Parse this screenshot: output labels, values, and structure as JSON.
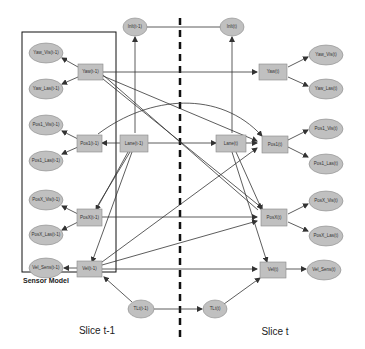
{
  "diagram": {
    "type": "dynamic-bayesian-network",
    "colors": {
      "node_fill": "#c0c0c0",
      "node_stroke": "#888888",
      "edge": "#333333",
      "divider": "#111111",
      "box": "#111111"
    },
    "sensor_model_label": "Sensor Model",
    "slice_labels": {
      "left": "Slice t-1",
      "right": "Slice t"
    },
    "nodes": {
      "inlt_prev": "Inlt(t-1)",
      "inlt_curr": "Inlt(t)",
      "yaw_vis_prev": "Yaw_Vis(t-1)",
      "yaw_las_prev": "Yaw_Las(t-1)",
      "yaw_prev": "Yaw(t-1)",
      "yaw_curr": "Yaw(t)",
      "yaw_vis_curr": "Yaw_Vis(t)",
      "yaw_las_curr": "Yaw_Las(t)",
      "pos1_vis_prev": "Pos1_Vis(t-1)",
      "pos1_las_prev": "Pos1_Las(t-1)",
      "pos1_prev": "Pos1(t-1)",
      "lane_prev": "Lane(t-1)",
      "lane_curr": "Lane(t)",
      "pos1_curr": "Pos1(t)",
      "pos1_vis_curr": "Pos1_Vis(t)",
      "pos1_las_curr": "Pos1_Las(t)",
      "posx_vis_prev": "PosX_Vis(t-1)",
      "posx_las_prev": "PosX_Las(t-1)",
      "posx_prev": "PosX(t-1)",
      "posx_curr": "PosX(t)",
      "posx_vis_curr": "PosX_Vis(t)",
      "posx_las_curr": "PosX_Las(t)",
      "vel_sens_prev": "Vel_Sens(t-1)",
      "vel_prev": "Vel(t-1)",
      "vel_curr": "Vel(t)",
      "vel_sens_curr": "Vel_Sens(t)",
      "tlt_prev": "TLt(t-1)",
      "tlt_curr": "TLt(t)"
    }
  }
}
